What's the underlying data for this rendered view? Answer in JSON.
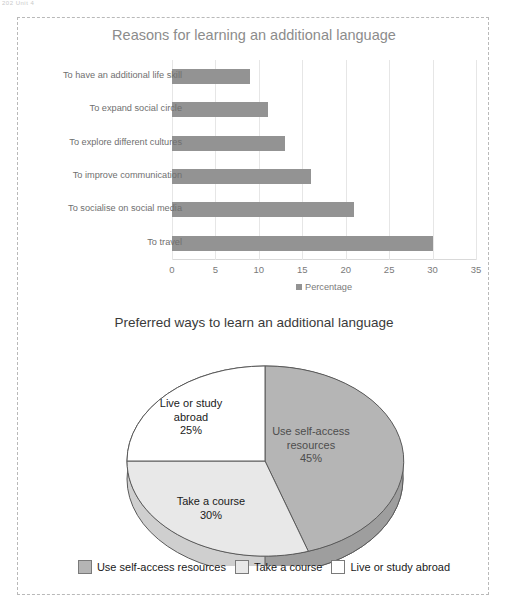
{
  "page": {
    "corner_artifact": "202  Unit 4"
  },
  "bar_chart": {
    "title": "Reasons for learning an additional language",
    "legend_label": "Percentage",
    "bar_color": "#939393",
    "xticks": [
      "0",
      "5",
      "10",
      "15",
      "20",
      "25",
      "30",
      "35"
    ]
  },
  "pie_chart": {
    "title": "Preferred ways to learn an additional language",
    "labels": [
      {
        "text": "Use self-access\nresources\n45%"
      },
      {
        "text": "Take a course\n30%"
      },
      {
        "text": "Live or study\nabroad\n25%"
      }
    ],
    "legend": [
      {
        "label": "Use self-access resources",
        "color": "#b5b5b5"
      },
      {
        "label": "Take a course",
        "color": "#e8e8e8"
      },
      {
        "label": "Live or study abroad",
        "color": "#ffffff"
      }
    ]
  },
  "chart_data": [
    {
      "type": "bar",
      "orientation": "horizontal",
      "title": "Reasons for learning an additional language",
      "xlabel": "",
      "ylabel": "",
      "xlim": [
        0,
        35
      ],
      "grid": true,
      "legend": [
        "Percentage"
      ],
      "legend_position": "bottom",
      "categories": [
        "To have an additional life skill",
        "To expand social circle",
        "To explore different cultures",
        "To improve communication",
        "To socialise on social media",
        "To travel"
      ],
      "values": [
        9,
        11,
        13,
        16,
        21,
        30
      ],
      "xticks": [
        0,
        5,
        10,
        15,
        20,
        25,
        30,
        35
      ],
      "series_name": "Percentage",
      "color": "#939393"
    },
    {
      "type": "pie",
      "title": "Preferred ways to learn an additional language",
      "three_d": true,
      "legend_position": "bottom",
      "categories": [
        "Use self-access resources",
        "Take a course",
        "Live or study abroad"
      ],
      "values": [
        45,
        30,
        25
      ],
      "value_suffix": "%",
      "colors": [
        "#b5b5b5",
        "#e8e8e8",
        "#ffffff"
      ],
      "start_angle_deg": 0,
      "direction": "clockwise"
    }
  ]
}
